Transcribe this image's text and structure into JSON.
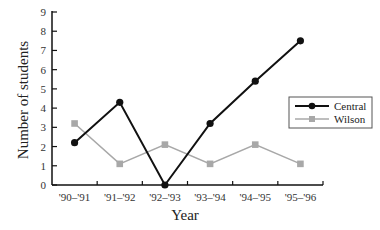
{
  "chart_data": {
    "type": "line",
    "title": "",
    "xlabel": "Year",
    "ylabel": "Number of students",
    "categories": [
      "'90–'91",
      "'91–'92",
      "'92–'93",
      "'93–'94",
      "'94–'95",
      "'95–'96"
    ],
    "series": [
      {
        "name": "Central",
        "color": "#111111",
        "marker": "circle",
        "values": [
          2.2,
          4.3,
          0,
          3.2,
          5.4,
          7.5
        ]
      },
      {
        "name": "Wilson",
        "color": "#a8a8a8",
        "marker": "square",
        "values": [
          3.2,
          1.1,
          2.1,
          1.1,
          2.1,
          1.1
        ]
      }
    ],
    "ylim": [
      0,
      9
    ],
    "yticks": [
      0,
      1,
      2,
      3,
      4,
      5,
      6,
      7,
      8,
      9
    ],
    "grid": false,
    "legend_position": "right"
  }
}
